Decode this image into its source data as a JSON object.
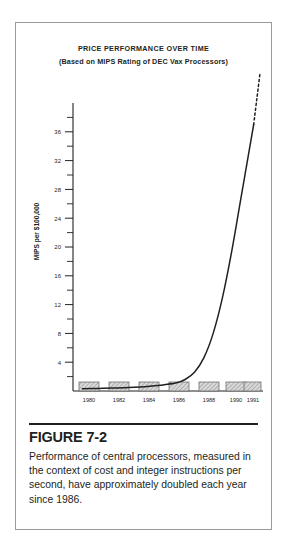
{
  "figure": {
    "heading": "FIGURE 7-2",
    "body": "Performance of central processors, measured in the context of cost and integer instructions per second, have approximately doubled each year since 1986."
  },
  "chart_data": {
    "type": "line",
    "title": "PRICE PERFORMANCE OVER TIME",
    "subtitle": "(Based on MIPS Rating of DEC Vax Processors)",
    "xlabel": "",
    "ylabel": "MIPS per $100,000",
    "xlim": [
      1979.4,
      1991.6
    ],
    "ylim": [
      0,
      40
    ],
    "grid": false,
    "legend": false,
    "x_tick_labels": [
      "1980",
      "1982",
      "1984",
      "1986",
      "1988",
      "1990",
      "1991"
    ],
    "x_tick_values": [
      1980,
      1982,
      1984,
      1986,
      1988,
      1990,
      1991
    ],
    "y_major_ticks": [
      4,
      8,
      12,
      16,
      20,
      24,
      28,
      32,
      36
    ],
    "y_minor_ticks": [
      2,
      6,
      10,
      14,
      18,
      22,
      26,
      30,
      34,
      38
    ],
    "y_tick_labels": [
      "4",
      "8",
      "12",
      "16",
      "20",
      "24",
      "28",
      "32",
      "36"
    ],
    "series": [
      {
        "name": "MIPS per $100,000",
        "style": "solid",
        "x": [
          1980.0,
          1981.0,
          1982.0,
          1983.0,
          1984.0,
          1985.0,
          1986.0,
          1986.6,
          1987.2,
          1987.8,
          1988.4,
          1989.0,
          1989.6,
          1990.2,
          1990.8,
          1991.0
        ],
        "values": [
          0.3,
          0.35,
          0.4,
          0.5,
          0.6,
          0.8,
          1.1,
          1.6,
          2.6,
          4.6,
          8.0,
          13.0,
          19.5,
          27.0,
          34.5,
          37.0
        ]
      },
      {
        "name": "Projected",
        "style": "dashed",
        "x": [
          1991.0,
          1991.2,
          1991.4
        ],
        "values": [
          37.0,
          40.5,
          44.0
        ]
      }
    ],
    "x_tick_marker": "hatched-box",
    "annotation": "Curve rises nearly exponentially after 1986 and is extrapolated beyond 1991 as a dashed line."
  },
  "colors": {
    "ink": "#231f20",
    "frame": "#9a9a9a",
    "axis": "#231f20",
    "hatch_fill": "#d6d6d6",
    "hatch_line": "#8c8c8c",
    "page": "#ffffff"
  }
}
